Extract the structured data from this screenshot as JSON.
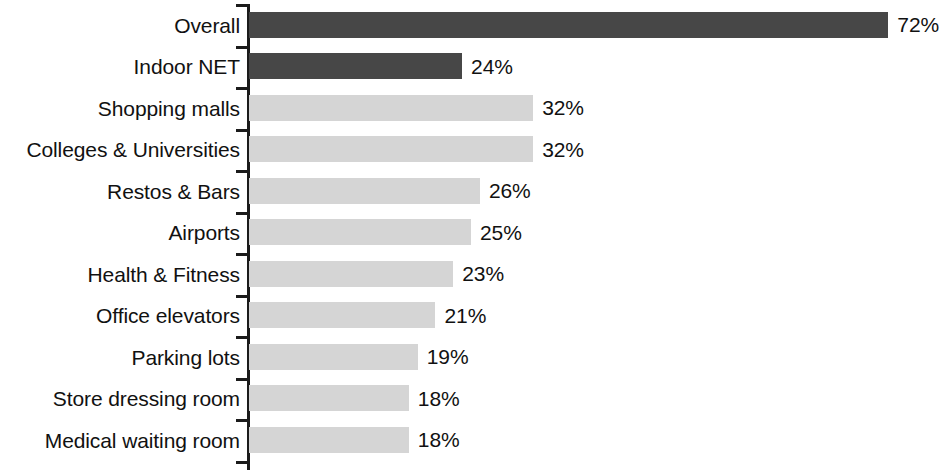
{
  "chart_data": {
    "type": "bar",
    "orientation": "horizontal",
    "title": "",
    "subtitle": "",
    "xlabel": "",
    "ylabel": "",
    "xlim": [
      0,
      78
    ],
    "grid": false,
    "legend": null,
    "value_suffix": "%",
    "categories": [
      "Overall",
      "Indoor NET",
      "Shopping malls",
      "Colleges & Universities",
      "Restos & Bars",
      "Airports",
      "Health & Fitness",
      "Office elevators",
      "Parking lots",
      "Store dressing room",
      "Medical waiting room"
    ],
    "values": [
      72,
      24,
      32,
      32,
      26,
      25,
      23,
      21,
      19,
      18,
      18
    ],
    "value_labels": [
      "72%",
      "24%",
      "32%",
      "32%",
      "26%",
      "25%",
      "23%",
      "21%",
      "19%",
      "18%",
      "18%"
    ],
    "bar_styles": [
      "dark",
      "dark",
      "light",
      "light",
      "light",
      "light",
      "light",
      "light",
      "light",
      "light",
      "light"
    ],
    "colors": {
      "dark_bar": "#474747",
      "light_bar": "#d5d5d5",
      "axis": "#1b1b1b",
      "text": "#111111",
      "background": "#ffffff"
    }
  },
  "axis": {
    "tick_count": 12,
    "spine_name": "category-axis"
  }
}
